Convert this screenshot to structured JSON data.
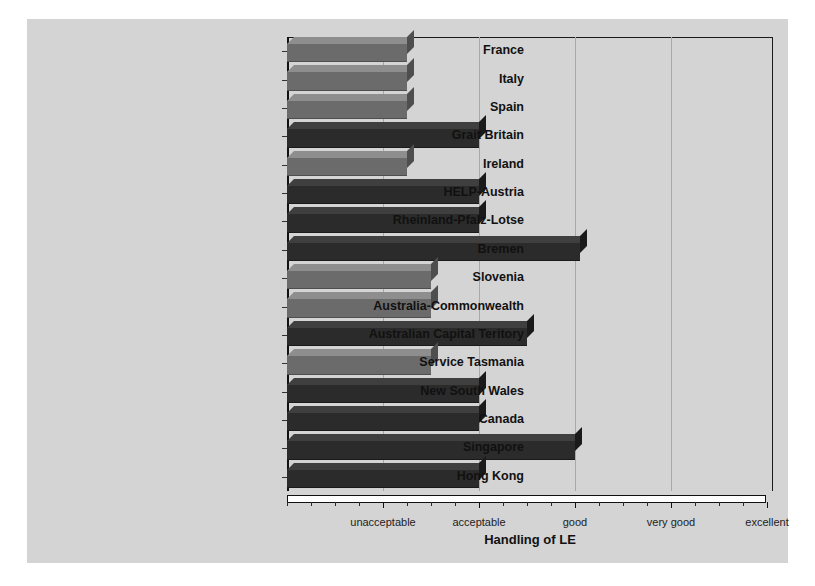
{
  "chart_data": {
    "type": "bar",
    "orientation": "horizontal",
    "title": "",
    "xlabel": "Handling of LE",
    "ylabel": "",
    "xlim": [
      0,
      5
    ],
    "grid": true,
    "legend": "none",
    "tick_labels": [
      "unacceptable",
      "acceptable",
      "good",
      "very good",
      "excellent"
    ],
    "tick_values": [
      1,
      2,
      3,
      4,
      5
    ],
    "categories": [
      "France",
      "Italy",
      "Spain",
      "Grait Britain",
      "Ireland",
      "HELP-Austria",
      "Rheinland-Pfalz-Lotse",
      "Bremen",
      "Slovenia",
      "Australia-Commonwealth",
      "Australian Capital Teritory",
      "Service Tasmania",
      "New South Wales",
      "Canada",
      "Singapore",
      "Hong Kong"
    ],
    "values": [
      1.25,
      1.25,
      1.25,
      2.0,
      1.25,
      2.0,
      2.0,
      3.05,
      1.5,
      1.5,
      2.5,
      1.5,
      2.0,
      2.0,
      3.0,
      2.0
    ],
    "bar_shades": [
      "mid",
      "mid",
      "mid",
      "dark",
      "mid",
      "dark",
      "dark",
      "dark",
      "mid",
      "mid",
      "dark",
      "mid",
      "dark",
      "dark",
      "dark",
      "dark"
    ]
  },
  "colors": {
    "figure_background": "#d4d4d4",
    "plot_background": "#d4d4d4",
    "bar_mid": "#6b6b6b",
    "bar_mid_top": "#8e8e8e",
    "bar_mid_side": "#4e4e4e",
    "bar_dark": "#2b2b2b",
    "bar_dark_top": "#3f3f3f",
    "bar_dark_side": "#1a1a1a",
    "grid": "#a8a8a8",
    "axis": "#111111",
    "text": "#111111",
    "floor": "#fdfdfd"
  }
}
